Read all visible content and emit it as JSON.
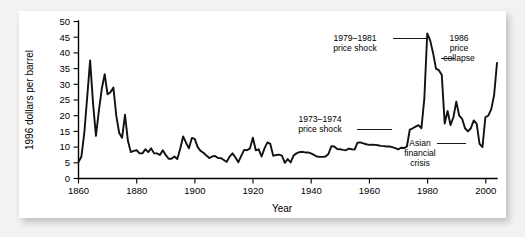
{
  "figure": {
    "background_color": "#ffffff",
    "page_background_color": "#f2f2f2",
    "line_color": "#111111"
  },
  "chart_data": {
    "type": "line",
    "title": "",
    "subtitle": "",
    "xlabel": "Year",
    "ylabel": "1996 dollars per barrel",
    "xlim": [
      1860,
      2004
    ],
    "ylim": [
      0,
      50
    ],
    "grid": false,
    "legend": null,
    "xticks": [
      1860,
      1880,
      1900,
      1920,
      1940,
      1960,
      1980,
      2000
    ],
    "xtick_labels": [
      "1860",
      "1880",
      "1900",
      "1920",
      "1940",
      "1960",
      "1980",
      "2000"
    ],
    "yticks": [
      0,
      5,
      10,
      15,
      20,
      25,
      30,
      35,
      40,
      45,
      50
    ],
    "ytick_labels": [
      "0",
      "5",
      "10",
      "15",
      "20",
      "25",
      "30",
      "35",
      "40",
      "45",
      "50"
    ],
    "series": [
      {
        "name": "Crude oil price (1996 dollars per barrel)",
        "x": [
          1860,
          1861,
          1862,
          1863,
          1864,
          1865,
          1866,
          1867,
          1868,
          1869,
          1870,
          1871,
          1872,
          1873,
          1874,
          1875,
          1876,
          1877,
          1878,
          1879,
          1880,
          1881,
          1882,
          1883,
          1884,
          1885,
          1886,
          1887,
          1888,
          1889,
          1890,
          1891,
          1892,
          1893,
          1894,
          1895,
          1896,
          1897,
          1898,
          1899,
          1900,
          1901,
          1902,
          1903,
          1904,
          1905,
          1906,
          1907,
          1908,
          1909,
          1910,
          1911,
          1912,
          1913,
          1914,
          1915,
          1916,
          1917,
          1918,
          1919,
          1920,
          1921,
          1922,
          1923,
          1924,
          1925,
          1926,
          1927,
          1928,
          1929,
          1930,
          1931,
          1932,
          1933,
          1934,
          1935,
          1936,
          1937,
          1938,
          1939,
          1940,
          1941,
          1942,
          1943,
          1944,
          1945,
          1946,
          1947,
          1948,
          1949,
          1950,
          1951,
          1952,
          1953,
          1954,
          1955,
          1956,
          1957,
          1958,
          1959,
          1960,
          1961,
          1962,
          1963,
          1964,
          1965,
          1966,
          1967,
          1968,
          1969,
          1970,
          1971,
          1972,
          1973,
          1974,
          1975,
          1976,
          1977,
          1978,
          1979,
          1980,
          1981,
          1982,
          1983,
          1984,
          1985,
          1986,
          1987,
          1988,
          1989,
          1990,
          1991,
          1992,
          1993,
          1994,
          1995,
          1996,
          1997,
          1998,
          1999,
          2000,
          2001,
          2002,
          2003,
          2004
        ],
        "values": [
          5.2,
          7.0,
          14.5,
          26.0,
          37.6,
          24.0,
          13.6,
          21.5,
          28.5,
          33.2,
          26.8,
          27.5,
          29.0,
          20.0,
          14.5,
          13.0,
          20.3,
          12.0,
          8.4,
          8.8,
          9.0,
          8.0,
          8.0,
          9.3,
          8.4,
          9.6,
          8.0,
          8.0,
          7.5,
          9.0,
          7.5,
          6.3,
          6.3,
          7.0,
          6.2,
          9.5,
          13.4,
          11.4,
          9.6,
          12.9,
          12.6,
          10.0,
          8.8,
          8.2,
          7.3,
          6.5,
          7.0,
          7.2,
          6.5,
          6.5,
          5.9,
          5.3,
          7.0,
          8.0,
          6.7,
          5.2,
          7.2,
          9.1,
          9.0,
          9.6,
          13.0,
          9.0,
          9.3,
          7.0,
          9.6,
          11.5,
          11.0,
          7.2,
          7.5,
          7.6,
          7.3,
          5.0,
          6.2,
          5.1,
          7.3,
          8.0,
          8.4,
          8.5,
          8.3,
          8.3,
          8.0,
          7.5,
          7.0,
          6.9,
          6.9,
          7.0,
          7.8,
          10.3,
          10.2,
          9.4,
          9.3,
          9.1,
          9.0,
          9.5,
          9.3,
          9.2,
          11.4,
          11.5,
          11.2,
          10.9,
          10.7,
          10.8,
          10.7,
          10.6,
          10.4,
          10.3,
          10.2,
          10.2,
          10.0,
          9.7,
          9.3,
          9.8,
          9.7,
          10.2,
          15.6,
          16.0,
          16.5,
          17.0,
          16.0,
          25.5,
          46.2,
          44.0,
          40.0,
          35.0,
          34.5,
          33.0,
          17.5,
          21.5,
          17.0,
          19.5,
          24.5,
          20.0,
          19.0,
          16.0,
          15.0,
          16.0,
          18.5,
          17.5,
          11.0,
          10.0,
          19.5,
          20.0,
          22.0,
          26.5,
          36.8
        ]
      }
    ],
    "annotations": [
      {
        "name": "price-shock-1973-1974",
        "text_lines": [
          "1973–1974",
          "price shock"
        ],
        "target_year": 1974,
        "target_value": 15.6
      },
      {
        "name": "price-shock-1979-1981",
        "text_lines": [
          "1979–1981",
          "price shock"
        ],
        "target_year": 1980,
        "target_value": 46.2
      },
      {
        "name": "price-collapse-1986",
        "text_lines": [
          "1986",
          "price",
          "collapse"
        ],
        "target_year": 1985,
        "target_value": 33.0
      },
      {
        "name": "asian-financial-crisis",
        "text_lines": [
          "Asian",
          "financial",
          "crisis"
        ],
        "target_year": 1998,
        "target_value": 10.0
      }
    ]
  }
}
